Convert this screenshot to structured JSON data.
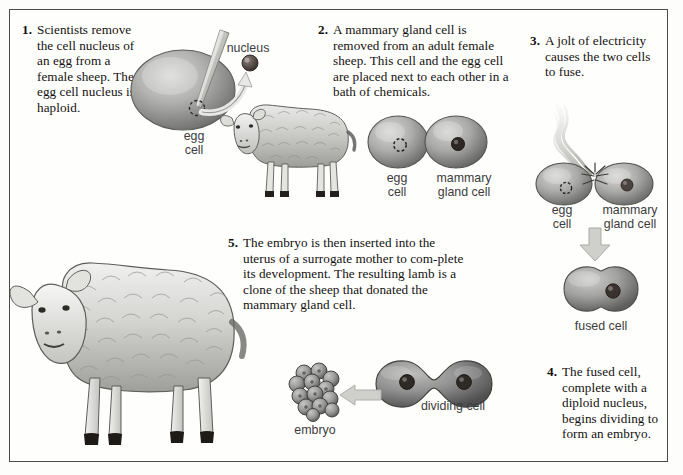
{
  "figure": {
    "background_color": "#fdfdfb",
    "frame_color": "#4a4a4a",
    "body_text_color": "#14110f",
    "label_text_color": "#3c3c3c"
  },
  "steps": [
    {
      "number": "1.",
      "text": "Scientists remove the cell nucleus of an egg from a female sheep. The egg cell nucleus is haploid."
    },
    {
      "number": "2.",
      "text": "A mammary gland cell is removed from an adult female sheep. This cell and the egg cell are placed next to each other in a bath of chemicals."
    },
    {
      "number": "3.",
      "text": "A jolt of electricity causes the two cells to fuse."
    },
    {
      "number": "4.",
      "text": "The fused cell, complete with a diploid nucleus, begins dividing to form an embryo."
    },
    {
      "number": "5.",
      "text": "The embryo is then inserted into the uterus of a surrogate mother to com-plete its development. The resulting lamb is a clone of the sheep that donated the mammary gland cell."
    }
  ],
  "labels": {
    "nucleus": "nucleus",
    "egg_cell_top": "egg\ncell",
    "egg_cell_pair": "egg\ncell",
    "mammary_gland_cell_pair": "mammary\ngland cell",
    "egg_cell_fusing": "egg\ncell",
    "mammary_gland_cell_fusing": "mammary\ngland cell",
    "fused_cell": "fused cell",
    "dividing_cell": "dividing cell",
    "embryo": "embryo"
  },
  "illustrations": [
    {
      "name": "egg-cell-with-pipette",
      "description": "Large oval egg cell with a glass micropipette inserted, dashed circle marking nucleus site"
    },
    {
      "name": "extracted-nucleus",
      "description": "Small dark sphere pulled out along a curved arrow"
    },
    {
      "name": "donor-sheep",
      "description": "Adult female sheep, side view facing left"
    },
    {
      "name": "cell-pair",
      "description": "Egg cell (dashed empty nucleus) beside mammary gland cell (solid dark nucleus)"
    },
    {
      "name": "lightning-bolt",
      "description": "Wavy electric jolt striking the junction of the two cells"
    },
    {
      "name": "fusing-cell-pair",
      "description": "Two cells touching with electric spark at the contact point"
    },
    {
      "name": "fused-cell",
      "description": "Single peanut-shaped fused cell with one dark diploid nucleus"
    },
    {
      "name": "dividing-cell",
      "description": "Dumbbell-shaped dividing cell with two dark nuclei"
    },
    {
      "name": "embryo-morula",
      "description": "Cluster of about fourteen rounded embryonic cells"
    },
    {
      "name": "cloned-lamb-sheep",
      "description": "Large adult sheep, side view facing left, the resulting clone"
    }
  ],
  "arrows": [
    {
      "name": "nucleus-extraction-arrow",
      "direction": "up-right"
    },
    {
      "name": "fusion-down-arrow",
      "direction": "down"
    },
    {
      "name": "embryo-left-arrow",
      "direction": "left"
    }
  ]
}
